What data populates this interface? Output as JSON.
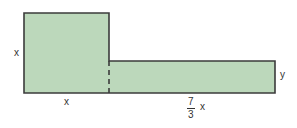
{
  "diagram": {
    "colors": {
      "fill": "#bcd8bb",
      "stroke": "#3b3b3b",
      "text": "#333333"
    },
    "square": {
      "side_label_left": "x",
      "side_label_bottom": "x"
    },
    "rectangle": {
      "height_label": "y",
      "length_label": {
        "numerator": "7",
        "denominator": "3",
        "variable": "x"
      }
    }
  }
}
